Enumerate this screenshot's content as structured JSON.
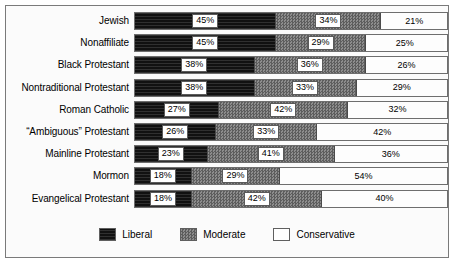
{
  "chart_data": {
    "type": "bar",
    "orientation": "horizontal",
    "stacked": true,
    "stack_total": 100,
    "unit": "%",
    "title": "",
    "subtitle": "",
    "xlabel": "",
    "ylabel": "",
    "xlim": [
      0,
      100
    ],
    "grid": false,
    "legend_position": "bottom-center",
    "categories": [
      "Jewish",
      "Nonaffiliate",
      "Black Protestant",
      "Nontraditional Protestant",
      "Roman Catholic",
      "“Ambiguous” Protestant",
      "Mainline Protestant",
      "Mormon",
      "Evangelical Protestant"
    ],
    "series": [
      {
        "name": "Liberal",
        "values": [
          45,
          45,
          38,
          38,
          27,
          26,
          23,
          18,
          18
        ],
        "labels": [
          "45%",
          "45%",
          "38%",
          "38%",
          "27%",
          "26%",
          "23%",
          "18%",
          "18%"
        ]
      },
      {
        "name": "Moderate",
        "values": [
          34,
          29,
          36,
          33,
          42,
          33,
          41,
          29,
          42
        ],
        "labels": [
          "34%",
          "29%",
          "36%",
          "33%",
          "42%",
          "33%",
          "41%",
          "29%",
          "42%"
        ]
      },
      {
        "name": "Conservative",
        "values": [
          21,
          25,
          26,
          29,
          32,
          42,
          36,
          54,
          40
        ],
        "labels": [
          "21%",
          "25%",
          "26%",
          "29%",
          "32%",
          "42%",
          "36%",
          "54%",
          "40%"
        ]
      }
    ]
  },
  "legend": {
    "items": [
      {
        "label": "Liberal",
        "swatch": "solid-black"
      },
      {
        "label": "Moderate",
        "swatch": "checkered-gray"
      },
      {
        "label": "Conservative",
        "swatch": "white-outline"
      }
    ]
  }
}
